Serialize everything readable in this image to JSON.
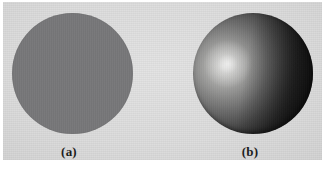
{
  "figure": {
    "panel_background_color": "#dcdcdc",
    "page_background_color": "#ffffff",
    "subfigures": [
      {
        "label": "(a)",
        "name": "flat-shaded-sphere",
        "description": "uniform flat gray disc with no shading",
        "fill_color": "#78787a",
        "center_x": 72,
        "center_y": 73,
        "diameter": 121
      },
      {
        "label": "(b)",
        "name": "smooth-shaded-sphere",
        "description": "sphere with diffuse gradient and specular highlight",
        "highlight_color": "#ffffff",
        "mid_color": "#8f8f8e",
        "shadow_color": "#070707",
        "highlight_x_pct": 29,
        "highlight_y_pct": 42,
        "center_x": 253,
        "center_y": 73,
        "diameter": 120
      }
    ]
  }
}
